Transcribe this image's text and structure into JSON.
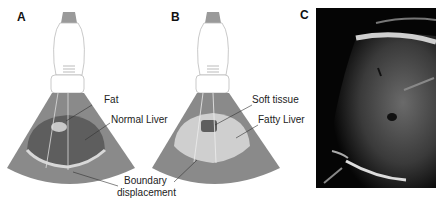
{
  "figure": {
    "panels": [
      {
        "letter": "A",
        "labels": {
          "top": "Fat",
          "middle": "Normal Liver",
          "bottom_line1": "Boundary",
          "bottom_line2": "displacement"
        }
      },
      {
        "letter": "B",
        "labels": {
          "top": "Soft tissue",
          "middle": "Fatty Liver"
        }
      },
      {
        "letter": "C"
      }
    ],
    "colors": {
      "sector": "#8a8a8a",
      "liver_dark": "#5e5e5e",
      "fat_light": "#c8c8c8",
      "probe_head": "#9a9a9a"
    }
  }
}
